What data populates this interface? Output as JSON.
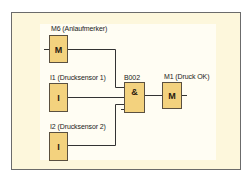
{
  "diagram": {
    "type": "LOGO! function block diagram",
    "colors": {
      "frame_background": "#fdf7dc",
      "inner_background": "#fffdf3",
      "block_fill": "#f3d27e",
      "block_border": "#5a5040",
      "wire": "#333333",
      "frame_border": "#6b6b6b"
    },
    "blocks": [
      {
        "id": "M6",
        "symbol": "M",
        "label": "M6 (Anlaufmerker)",
        "kind": "flag-input"
      },
      {
        "id": "I1",
        "symbol": "I",
        "label": "I1 (Drucksensor 1)",
        "kind": "input"
      },
      {
        "id": "I2",
        "symbol": "I",
        "label": "I2 (Drucksensor 2)",
        "kind": "input"
      },
      {
        "id": "B002",
        "symbol": "&",
        "label": "B002",
        "kind": "and-gate"
      },
      {
        "id": "M1",
        "symbol": "M",
        "label": "M1 (Druck OK)",
        "kind": "flag-output"
      }
    ],
    "connections": [
      {
        "from": "M6",
        "to": "B002",
        "input": 1
      },
      {
        "from": "I1",
        "to": "B002",
        "input": 2
      },
      {
        "from": "I2",
        "to": "B002",
        "input": 3
      },
      {
        "from": "B002",
        "to": "M1",
        "input": 1
      }
    ]
  }
}
